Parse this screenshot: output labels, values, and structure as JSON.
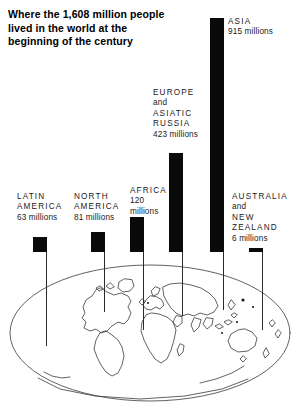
{
  "title": {
    "line1": "Where the 1,608 million people",
    "line2": "lived in the world at the",
    "line3": "beginning of the century"
  },
  "chart_data": {
    "type": "bar",
    "title": "Where the 1,608 million people lived in the world at the beginning of the century",
    "unit": "millions",
    "total": 1608,
    "xlabel": "",
    "ylabel": "Population (millions)",
    "ylim": [
      0,
      915
    ],
    "grid": false,
    "legend": "none",
    "categories": [
      "LATIN AMERICA",
      "NORTH AMERICA",
      "AFRICA",
      "EUROPE and ASIATIC RUSSIA",
      "ASIA",
      "AUSTRALIA and NEW ZEALAND"
    ],
    "values": [
      63,
      81,
      120,
      423,
      915,
      6
    ]
  },
  "bars": [
    {
      "id": "latin-america",
      "name_lines": [
        "LATIN",
        "AMERICA"
      ],
      "value_text": "63 millions",
      "value": 63,
      "label_x": 17,
      "label_y": 192,
      "bar_x": 33,
      "bar_y": 237,
      "bar_w": 14,
      "bar_h": 15,
      "stem_x": 46,
      "stem_y": 252,
      "stem_h": 94
    },
    {
      "id": "north-america",
      "name_lines": [
        "NORTH",
        "AMERICA"
      ],
      "value_text": "81 millions",
      "value": 81,
      "label_x": 74,
      "label_y": 192,
      "bar_x": 91,
      "bar_y": 232,
      "bar_w": 14,
      "bar_h": 20,
      "stem_x": 104,
      "stem_y": 252,
      "stem_h": 60
    },
    {
      "id": "africa",
      "name_lines": [
        "AFRICA"
      ],
      "value_lines": [
        "120",
        "millions"
      ],
      "value_text": "120 millions",
      "value": 120,
      "label_x": 130,
      "label_y": 186,
      "bar_x": 130,
      "bar_y": 217,
      "bar_w": 14,
      "bar_h": 35,
      "stem_x": 143,
      "stem_y": 252,
      "stem_h": 78
    },
    {
      "id": "europe-asiatic-russia",
      "name_lines": [
        "EUROPE",
        "and",
        "ASIATIC",
        "RUSSIA"
      ],
      "value_text": "423 millions",
      "value": 423,
      "label_x": 153,
      "label_y": 88,
      "bar_x": 169,
      "bar_y": 153,
      "bar_w": 14,
      "bar_h": 99,
      "stem_x": 182,
      "stem_y": 252,
      "stem_h": 64
    },
    {
      "id": "asia",
      "name_lines": [
        "ASIA"
      ],
      "value_text": "915 millions",
      "value": 915,
      "label_x": 228,
      "label_y": 17,
      "bar_x": 210,
      "bar_y": 18,
      "bar_w": 14,
      "bar_h": 234,
      "stem_x": 223,
      "stem_y": 252,
      "stem_h": 58
    },
    {
      "id": "australia-new-zealand",
      "name_lines": [
        "AUSTRALIA",
        "and",
        "NEW",
        "ZEALAND"
      ],
      "value_text": "6 millions",
      "value": 6,
      "label_x": 232,
      "label_y": 192,
      "bar_x": 249,
      "bar_y": 248,
      "bar_w": 14,
      "bar_h": 4,
      "stem_x": 262,
      "stem_y": 252,
      "stem_h": 78
    }
  ],
  "map": {
    "name": "world-oval-map",
    "shape": "oval",
    "outline_color": "#333333"
  }
}
